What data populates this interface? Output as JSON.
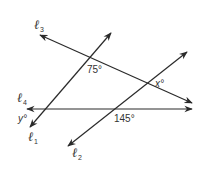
{
  "diagram": {
    "type": "parallel lines and transversals",
    "lines": [
      {
        "id": "l1",
        "name": "ℓ",
        "subscript": "1",
        "from": [
          30,
          127
        ],
        "to": [
          111,
          33
        ]
      },
      {
        "id": "l2",
        "name": "ℓ",
        "subscript": "2",
        "from": [
          68,
          146
        ],
        "to": [
          187,
          52
        ]
      },
      {
        "id": "l3",
        "name": "ℓ",
        "subscript": "3",
        "from": [
          40,
          35
        ],
        "to": [
          192,
          103
        ]
      },
      {
        "id": "l4",
        "name": "ℓ",
        "subscript": "4",
        "from": [
          27,
          109
        ],
        "to": [
          192,
          109
        ]
      }
    ],
    "angles": {
      "a75": "75°",
      "x": "x°",
      "y": "y°",
      "a145": "145°"
    },
    "line_labels": {
      "l1": "ℓ",
      "l1_sub": "1",
      "l2": "ℓ",
      "l2_sub": "2",
      "l3": "ℓ",
      "l3_sub": "3",
      "l4": "ℓ",
      "l4_sub": "4"
    },
    "colors": {
      "stroke": "#2a2a2a",
      "text": "#333333",
      "background": "#ffffff"
    }
  }
}
